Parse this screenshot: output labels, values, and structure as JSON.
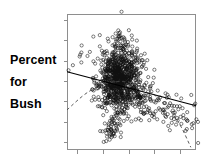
{
  "figure": {
    "width": 210,
    "height": 168,
    "background": "#ffffff"
  },
  "axis_label": {
    "name": "y-axis-label",
    "lines": [
      "Percent",
      "for",
      "Bush"
    ],
    "color": "#000000",
    "bold": true
  },
  "plot_frame": {
    "left": 67,
    "top": 14,
    "right": 196,
    "bottom": 150,
    "spine_color": "#8e8e8e",
    "y_tick_count": 7,
    "x_tick_count": 5,
    "tick_labels_visible": false
  },
  "chart_data": {
    "type": "scatter",
    "title": "",
    "xlabel": "",
    "ylabel": "Percent for Bush",
    "grid": false,
    "legend": null,
    "xlim": [
      0,
      1
    ],
    "ylim": [
      0,
      1
    ],
    "axis_tick_labels": {
      "x": [],
      "y": []
    },
    "marker": {
      "shape": "open-circle",
      "radius_px": 1.6,
      "stroke": "#111111",
      "fill": "none"
    },
    "annotations": [
      {
        "name": "regression-line",
        "kind": "line",
        "style": "solid",
        "color": "#000000",
        "x0": 0.0,
        "y0": 0.575,
        "x1": 1.0,
        "y1": 0.325
      },
      {
        "name": "smoothed-curve",
        "kind": "curve",
        "style": "dashed",
        "color": "#4a4a4a",
        "points": [
          [
            0.0,
            0.295
          ],
          [
            0.17,
            0.43
          ],
          [
            0.36,
            0.5
          ],
          [
            0.55,
            0.48
          ],
          [
            0.72,
            0.37
          ],
          [
            0.86,
            0.21
          ],
          [
            0.96,
            0.02
          ]
        ]
      }
    ],
    "clusters": [
      {
        "name": "main-dense-mass",
        "cx": 0.41,
        "cy": 0.52,
        "rx": 0.13,
        "ry": 0.2,
        "n": 900
      },
      {
        "name": "upper-plume",
        "cx": 0.41,
        "cy": 0.8,
        "rx": 0.05,
        "ry": 0.11,
        "n": 26
      },
      {
        "name": "right-fan",
        "cx": 0.68,
        "cy": 0.4,
        "rx": 0.2,
        "ry": 0.13,
        "n": 140
      },
      {
        "name": "lower-cluster",
        "cx": 0.33,
        "cy": 0.14,
        "rx": 0.05,
        "ry": 0.07,
        "n": 45
      },
      {
        "name": "sparse-left",
        "cx": 0.12,
        "cy": 0.66,
        "rx": 0.09,
        "ry": 0.12,
        "n": 10
      }
    ]
  }
}
